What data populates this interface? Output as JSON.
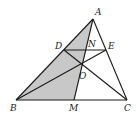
{
  "diagram": {
    "type": "geometry",
    "colors": {
      "stroke": "#1a1a1a",
      "shade": "#c8c8c8",
      "background": "#ffffff"
    },
    "points": {
      "A": {
        "label": "A",
        "x": 93,
        "y": 19,
        "lx": 95,
        "ly": 15
      },
      "B": {
        "label": "B",
        "x": 16,
        "y": 100,
        "lx": 10,
        "ly": 111
      },
      "C": {
        "label": "C",
        "x": 127,
        "y": 100,
        "lx": 124,
        "ly": 111
      },
      "M": {
        "label": "M",
        "x": 74,
        "y": 100,
        "lx": 69,
        "ly": 111
      },
      "D": {
        "label": "D",
        "x": 64,
        "y": 50,
        "lx": 55,
        "ly": 49
      },
      "E": {
        "label": "E",
        "x": 106,
        "y": 50,
        "lx": 108,
        "ly": 49
      },
      "N": {
        "label": "N",
        "x": 86,
        "y": 50,
        "lx": 88,
        "ly": 47
      },
      "O": {
        "label": "O",
        "x": 82,
        "y": 65,
        "lx": 79,
        "ly": 79
      }
    },
    "segments": [
      "AB",
      "AC",
      "BC",
      "DE",
      "AM",
      "BE",
      "CD"
    ],
    "shaded_region": [
      "A",
      "B",
      "M"
    ]
  }
}
